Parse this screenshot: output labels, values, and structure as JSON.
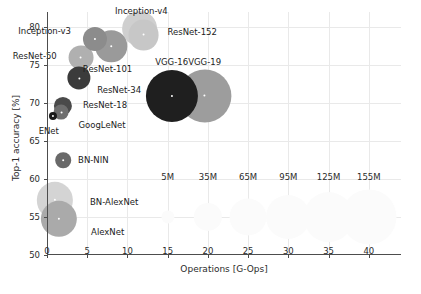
{
  "chart_data": {
    "type": "scatter",
    "title": "",
    "xlabel": "Operations [G-Ops]",
    "ylabel": "Top-1 accuracy [%]",
    "xlim": [
      0,
      44
    ],
    "ylim": [
      50,
      82
    ],
    "xticks": [
      0,
      5,
      10,
      15,
      20,
      25,
      30,
      35,
      40
    ],
    "yticks": [
      50,
      55,
      60,
      65,
      70,
      75,
      80
    ],
    "grid": true,
    "legend_position": "inside-middle",
    "size_encoding": "parameters",
    "points": [
      {
        "name": "ENet",
        "x": 0.7,
        "y": 68.3,
        "params_m": 1,
        "color": "#1a1a1a",
        "label_dx": -4,
        "label_dy": 15,
        "label_anchor": "middle"
      },
      {
        "name": "GoogLeNet",
        "x": 1.8,
        "y": 68.8,
        "params_m": 7,
        "color": "#6e6e6e",
        "label_dx": 17,
        "label_dy": 13,
        "label_anchor": "start"
      },
      {
        "name": "ResNet-18",
        "x": 2.0,
        "y": 69.6,
        "params_m": 12,
        "color": "#4a4a4a",
        "label_dx": 20,
        "label_dy": -1,
        "label_anchor": "start"
      },
      {
        "name": "BN-NIN",
        "x": 2.0,
        "y": 62.5,
        "params_m": 8,
        "color": "#696969",
        "label_dx": 15,
        "label_dy": 0,
        "label_anchor": "start"
      },
      {
        "name": "BN-AlexNet",
        "x": 1.0,
        "y": 57.2,
        "params_m": 62,
        "color": "#d4d4d4",
        "label_dx": 35,
        "label_dy": 2,
        "label_anchor": "start"
      },
      {
        "name": "AlexNet",
        "x": 1.5,
        "y": 54.8,
        "params_m": 62,
        "color": "#aaaaaa",
        "label_dx": 32,
        "label_dy": 13,
        "label_anchor": "start"
      },
      {
        "name": "ResNet-34",
        "x": 4.0,
        "y": 73.3,
        "params_m": 22,
        "color": "#3b3b3b",
        "label_dx": 18,
        "label_dy": 12,
        "label_anchor": "start"
      },
      {
        "name": "ResNet-50",
        "x": 4.2,
        "y": 76.0,
        "params_m": 26,
        "color": "#b0b0b0",
        "label_dx": -24,
        "label_dy": -2,
        "label_anchor": "end"
      },
      {
        "name": "Inception-v3",
        "x": 6.0,
        "y": 78.5,
        "params_m": 24,
        "color": "#8c8c8c",
        "label_dx": -24,
        "label_dy": -8,
        "label_anchor": "end"
      },
      {
        "name": "ResNet-101",
        "x": 8.0,
        "y": 77.5,
        "params_m": 45,
        "color": "#9a9a9a",
        "label_dx": -4,
        "label_dy": 23,
        "label_anchor": "middle"
      },
      {
        "name": "ResNet-152",
        "x": 11.5,
        "y": 79.8,
        "params_m": 60,
        "color": "#cfcfcf",
        "label_dx": 28,
        "label_dy": 3,
        "label_anchor": "start"
      },
      {
        "name": "Inception-v4",
        "x": 12.0,
        "y": 79.0,
        "params_m": 43,
        "color": "#c7c7c7",
        "label_dx": -2,
        "label_dy": -24,
        "label_anchor": "middle"
      },
      {
        "name": "VGG-16",
        "x": 15.5,
        "y": 71.0,
        "params_m": 138,
        "color": "#1f1f1f",
        "label_dx": 0,
        "label_dy": -34,
        "label_anchor": "middle"
      },
      {
        "name": "VGG-19",
        "x": 19.6,
        "y": 71.0,
        "params_m": 144,
        "color": "#9d9d9d",
        "label_dx": 0,
        "label_dy": -34,
        "label_anchor": "middle"
      }
    ],
    "size_legend": {
      "y": 55,
      "label_y": 60.2,
      "entries": [
        {
          "label": "5M",
          "x": 15,
          "params_m": 5
        },
        {
          "label": "35M",
          "x": 20,
          "params_m": 35
        },
        {
          "label": "65M",
          "x": 25,
          "params_m": 65
        },
        {
          "label": "95M",
          "x": 30,
          "params_m": 95
        },
        {
          "label": "125M",
          "x": 35,
          "params_m": 125
        },
        {
          "label": "155M",
          "x": 40,
          "params_m": 155
        }
      ]
    },
    "colors": {
      "axis": "#4d4d4d",
      "grid": "#e9e9e9",
      "text": "#1b1b1b",
      "background": "#ffffff",
      "legend_bubble": "#fbfbfb"
    }
  }
}
